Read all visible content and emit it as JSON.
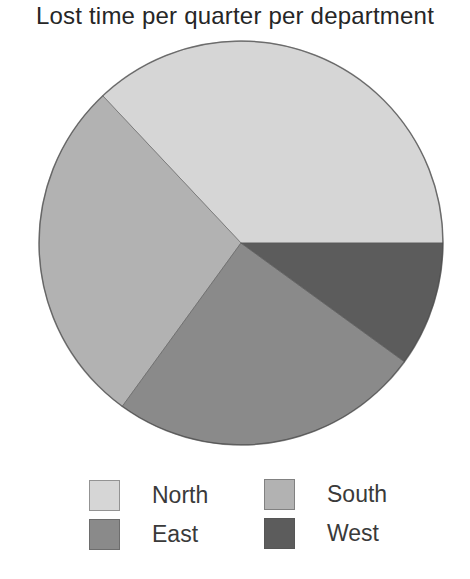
{
  "chart_data": {
    "type": "pie",
    "title": "Lost time per quarter per department",
    "categories": [
      "North",
      "South",
      "East",
      "West"
    ],
    "values": [
      37,
      28,
      25,
      10
    ],
    "unit": "percent (estimated)",
    "start_angle_deg": 0,
    "direction": "counterclockwise",
    "colors": [
      "#d6d6d6",
      "#b2b2b2",
      "#8a8a8a",
      "#5c5c5c"
    ],
    "legend_position": "bottom",
    "legend": [
      {
        "label": "North",
        "color": "#d6d6d6"
      },
      {
        "label": "South",
        "color": "#b2b2b2"
      },
      {
        "label": "East",
        "color": "#8a8a8a"
      },
      {
        "label": "West",
        "color": "#5c5c5c"
      }
    ]
  }
}
